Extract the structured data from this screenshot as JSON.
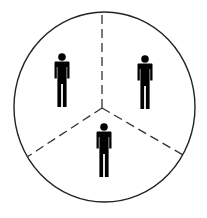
{
  "diagram": {
    "colors": {
      "background": "#ffffff",
      "circle_stroke": "#222222",
      "divider_stroke": "#333333",
      "figure_fill": "#000000"
    },
    "circle": {
      "cx": 104.5,
      "cy": 107,
      "rx": 90.5,
      "ry": 95
    },
    "center": {
      "x": 102,
      "y": 108
    },
    "dividers": [
      {
        "name": "top",
        "x2": 102,
        "y2": 12
      },
      {
        "name": "bottom-left",
        "x2": 27,
        "y2": 157
      },
      {
        "name": "bottom-right",
        "x2": 183,
        "y2": 155
      }
    ],
    "figures": [
      {
        "name": "person-top-left",
        "x": 62,
        "y": 57
      },
      {
        "name": "person-top-right",
        "x": 145,
        "y": 59
      },
      {
        "name": "person-bottom",
        "x": 104,
        "y": 127
      }
    ]
  }
}
